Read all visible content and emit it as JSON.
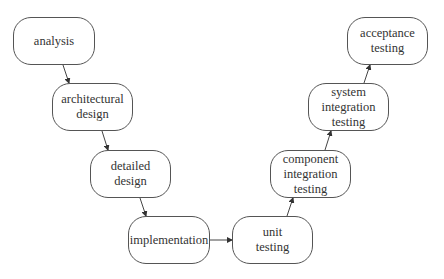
{
  "diagram": {
    "type": "v-model",
    "nodes": [
      {
        "id": "analysis",
        "lines": [
          "analysis"
        ],
        "x": 13,
        "y": 17,
        "w": 82,
        "h": 48
      },
      {
        "id": "architectural-design",
        "lines": [
          "architectural",
          "design"
        ],
        "x": 52,
        "y": 83,
        "w": 81,
        "h": 48
      },
      {
        "id": "detailed-design",
        "lines": [
          "detailed",
          "design"
        ],
        "x": 90,
        "y": 150,
        "w": 81,
        "h": 48
      },
      {
        "id": "implementation",
        "lines": [
          "implementation"
        ],
        "x": 128,
        "y": 216,
        "w": 82,
        "h": 48
      },
      {
        "id": "unit-testing",
        "lines": [
          "unit",
          "testing"
        ],
        "x": 232,
        "y": 216,
        "w": 81,
        "h": 48
      },
      {
        "id": "component-integration-testing",
        "lines": [
          "component",
          "integration",
          "testing"
        ],
        "x": 270,
        "y": 150,
        "w": 81,
        "h": 48
      },
      {
        "id": "system-integration-testing",
        "lines": [
          "system",
          "integration",
          "testing"
        ],
        "x": 308,
        "y": 83,
        "w": 81,
        "h": 48
      },
      {
        "id": "acceptance-testing",
        "lines": [
          "acceptance",
          "testing"
        ],
        "x": 347,
        "y": 17,
        "w": 81,
        "h": 48
      }
    ],
    "edges": [
      {
        "from": "analysis",
        "to": "architectural-design",
        "x1": 63,
        "y1": 65,
        "x2": 69,
        "y2": 83
      },
      {
        "from": "architectural-design",
        "to": "detailed-design",
        "x1": 102,
        "y1": 131,
        "x2": 108,
        "y2": 150
      },
      {
        "from": "detailed-design",
        "to": "implementation",
        "x1": 140,
        "y1": 198,
        "x2": 146,
        "y2": 216
      },
      {
        "from": "implementation",
        "to": "unit-testing",
        "x1": 210,
        "y1": 240,
        "x2": 232,
        "y2": 240
      },
      {
        "from": "unit-testing",
        "to": "component-integration-testing",
        "x1": 287,
        "y1": 216,
        "x2": 293,
        "y2": 198
      },
      {
        "from": "component-integration-testing",
        "to": "system-integration-testing",
        "x1": 325,
        "y1": 150,
        "x2": 331,
        "y2": 131
      },
      {
        "from": "system-integration-testing",
        "to": "acceptance-testing",
        "x1": 364,
        "y1": 83,
        "x2": 370,
        "y2": 65
      }
    ],
    "colors": {
      "stroke": "#555555",
      "text": "#333333",
      "background": "#ffffff"
    }
  }
}
